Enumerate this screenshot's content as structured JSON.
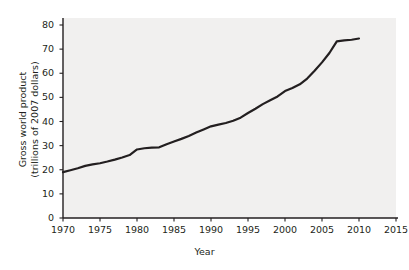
{
  "chart_data": {
    "type": "line",
    "title": "",
    "xlabel": "Year",
    "ylabel": "Gross world product (trillions of 2007 dollars)",
    "ylabel_line1": "Gross world product",
    "ylabel_line2": "(trillions of 2007 dollars)",
    "xlim": [
      1970,
      2016
    ],
    "ylim": [
      0,
      83
    ],
    "grid": false,
    "legend": null,
    "xticks": [
      1970,
      1975,
      1980,
      1985,
      1990,
      1995,
      2000,
      2005,
      2010,
      2015
    ],
    "yticks": [
      0,
      10,
      20,
      30,
      40,
      50,
      60,
      70,
      80
    ],
    "series": [
      {
        "name": "Gross world product",
        "color": "#231f20",
        "x": [
          1970,
          1971,
          1972,
          1973,
          1974,
          1975,
          1976,
          1977,
          1978,
          1979,
          1980,
          1981,
          1982,
          1983,
          1984,
          1985,
          1986,
          1987,
          1988,
          1989,
          1990,
          1991,
          1992,
          1993,
          1994,
          1995,
          1996,
          1997,
          1998,
          1999,
          2000,
          2001,
          2002,
          2003,
          2004,
          2005,
          2006,
          2007,
          2008,
          2009,
          2010
        ],
        "values": [
          19.0,
          19.8,
          20.6,
          21.6,
          22.2,
          22.7,
          23.4,
          24.2,
          25.1,
          26.1,
          28.4,
          28.9,
          29.2,
          29.3,
          30.6,
          31.7,
          32.8,
          34.0,
          35.4,
          36.7,
          38.0,
          38.7,
          39.4,
          40.3,
          41.6,
          43.5,
          45.3,
          47.2,
          48.8,
          50.4,
          52.6,
          53.9,
          55.4,
          57.8,
          61.0,
          64.5,
          68.4,
          73.2,
          73.6,
          73.9,
          74.4
        ]
      }
    ]
  },
  "axes": {
    "x_tick_labels": [
      "1970",
      "1975",
      "1980",
      "1985",
      "1990",
      "1995",
      "2000",
      "2005",
      "2010",
      "2015"
    ],
    "y_tick_labels": [
      "0",
      "10",
      "20",
      "30",
      "40",
      "50",
      "60",
      "70",
      "80"
    ],
    "x_title": "Year",
    "y_title_line1": "Gross world product",
    "y_title_line2": "(trillions of 2007 dollars)"
  },
  "style": {
    "panel_background": "#f1f0ef",
    "page_background": "#ffffff",
    "axis_color": "#231f20",
    "line_color": "#231f20",
    "text_color": "#231f20"
  }
}
